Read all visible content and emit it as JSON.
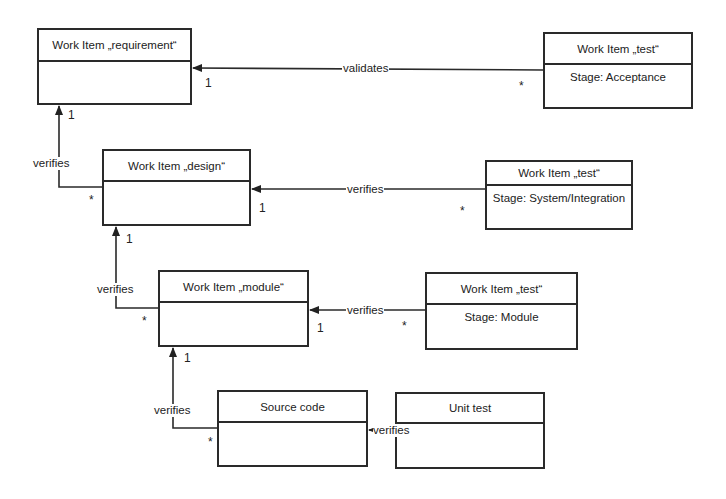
{
  "diagram": {
    "type": "uml-class-diagram",
    "boxes": {
      "requirement": {
        "title": "Work Item „requirement“",
        "attribute": ""
      },
      "test_acceptance": {
        "title": "Work Item „test“",
        "attribute": "Stage: Acceptance"
      },
      "design": {
        "title": "Work Item „design“",
        "attribute": ""
      },
      "test_system": {
        "title": "Work Item „test“",
        "attribute": "Stage: System/Integration"
      },
      "module": {
        "title": "Work Item „module“",
        "attribute": ""
      },
      "test_module": {
        "title": "Work Item „test“",
        "attribute": "Stage: Module"
      },
      "source_code": {
        "title": "Source code",
        "attribute": ""
      },
      "unit_test": {
        "title": "Unit test",
        "attribute": ""
      }
    },
    "relations": [
      {
        "from": "test_acceptance",
        "to": "requirement",
        "label": "validates",
        "to_mult": "1",
        "from_mult": "*"
      },
      {
        "from": "design",
        "to": "requirement",
        "label": "verifies",
        "to_mult": "1",
        "from_mult": "*"
      },
      {
        "from": "test_system",
        "to": "design",
        "label": "verifies",
        "to_mult": "1",
        "from_mult": "*"
      },
      {
        "from": "module",
        "to": "design",
        "label": "verifies",
        "to_mult": "1",
        "from_mult": "*"
      },
      {
        "from": "test_module",
        "to": "module",
        "label": "verifies",
        "to_mult": "1",
        "from_mult": "*"
      },
      {
        "from": "source_code",
        "to": "module",
        "label": "verifies",
        "to_mult": "1",
        "from_mult": "*"
      },
      {
        "from": "unit_test",
        "to": "source_code",
        "label": "verifies",
        "to_mult": "",
        "from_mult": ""
      }
    ]
  }
}
